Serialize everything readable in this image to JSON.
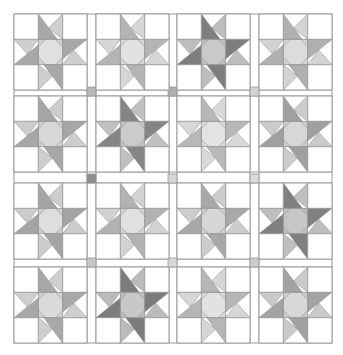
{
  "quilt": {
    "name": "Spinning star quilt layout",
    "rows": 4,
    "cols": 4,
    "origin": [
      14,
      14
    ],
    "block_size": [
      73,
      76
    ],
    "col_starts": [
      14,
      96,
      177,
      259
    ],
    "row_starts": [
      14,
      96,
      183,
      267
    ],
    "sashing_color": "#ffffff",
    "line_color": "#9a9a9a",
    "background_color": "#ffffff",
    "cornerstones": [
      {
        "x": 87,
        "y": 87,
        "color": "#b8b8b8"
      },
      {
        "x": 168,
        "y": 87,
        "color": "#aeaeae"
      },
      {
        "x": 250,
        "y": 87,
        "color": "#d4d4d4"
      },
      {
        "x": 87,
        "y": 174,
        "color": "#8e8e8e"
      },
      {
        "x": 168,
        "y": 174,
        "color": "#d6d6d6"
      },
      {
        "x": 250,
        "y": 174,
        "color": "#dadada"
      },
      {
        "x": 87,
        "y": 258,
        "color": "#c8c8c8"
      },
      {
        "x": 168,
        "y": 258,
        "color": "#d8d8d8"
      },
      {
        "x": 250,
        "y": 258,
        "color": "#cccccc"
      }
    ],
    "blocks": [
      {
        "row": 0,
        "col": 0,
        "dark": "#a8a8a8",
        "light": "#cfcfcf",
        "center": "#e0e0e0"
      },
      {
        "row": 0,
        "col": 1,
        "dark": "#b4b4b4",
        "light": "#d6d6d6",
        "center": "#e2e2e2"
      },
      {
        "row": 0,
        "col": 2,
        "dark": "#7e7e7e",
        "light": "#bdbdbd",
        "center": "#c9c9c9"
      },
      {
        "row": 0,
        "col": 3,
        "dark": "#b0b0b0",
        "light": "#d3d3d3",
        "center": "#dcdcdc"
      },
      {
        "row": 1,
        "col": 0,
        "dark": "#a6a6a6",
        "light": "#cdcdcd",
        "center": "#d8d8d8"
      },
      {
        "row": 1,
        "col": 1,
        "dark": "#858585",
        "light": "#c0c0c0",
        "center": "#cbcbcb"
      },
      {
        "row": 1,
        "col": 2,
        "dark": "#b8b8b8",
        "light": "#d8d8d8",
        "center": "#e3e3e3"
      },
      {
        "row": 1,
        "col": 3,
        "dark": "#a0a0a0",
        "light": "#cbcbcb",
        "center": "#d7d7d7"
      },
      {
        "row": 2,
        "col": 0,
        "dark": "#a4a4a4",
        "light": "#cccccc",
        "center": "#dedede"
      },
      {
        "row": 2,
        "col": 1,
        "dark": "#b2b2b2",
        "light": "#d2d2d2",
        "center": "#e0e0e0"
      },
      {
        "row": 2,
        "col": 2,
        "dark": "#a8a8a8",
        "light": "#cdcdcd",
        "center": "#d6d6d6"
      },
      {
        "row": 2,
        "col": 3,
        "dark": "#808080",
        "light": "#bebebe",
        "center": "#c6c6c6"
      },
      {
        "row": 3,
        "col": 0,
        "dark": "#a8a8a8",
        "light": "#cfcfcf",
        "center": "#dadada"
      },
      {
        "row": 3,
        "col": 1,
        "dark": "#7c7c7c",
        "light": "#bbbbbb",
        "center": "#c8c8c8"
      },
      {
        "row": 3,
        "col": 2,
        "dark": "#b6b6b6",
        "light": "#d6d6d6",
        "center": "#e2e2e2"
      },
      {
        "row": 3,
        "col": 3,
        "dark": "#a2a2a2",
        "light": "#cacaca",
        "center": "#d8d8d8"
      }
    ]
  }
}
